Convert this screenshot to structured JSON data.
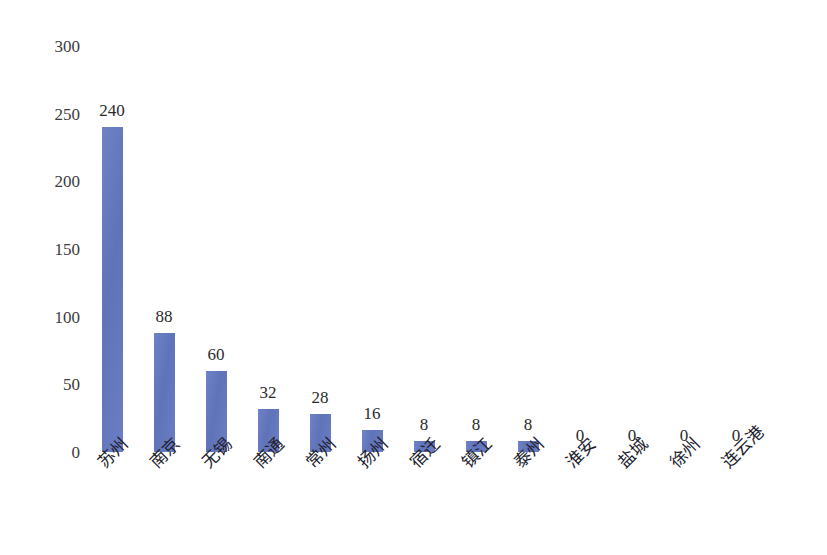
{
  "chart_data": {
    "type": "bar",
    "title": "",
    "xlabel": "",
    "ylabel": "",
    "ylim": [
      0,
      300
    ],
    "yticks": [
      0,
      50,
      100,
      150,
      200,
      250,
      300
    ],
    "grid": false,
    "legend": "none",
    "bar_color": "#6276bd",
    "categories": [
      "苏州",
      "南京",
      "无锡",
      "南通",
      "常州",
      "扬州",
      "宿迁",
      "镇江",
      "泰州",
      "淮安",
      "盐城",
      "徐州",
      "连云港"
    ],
    "values": [
      240,
      88,
      60,
      32,
      28,
      16,
      8,
      8,
      8,
      0,
      0,
      0,
      0
    ],
    "value_labels": [
      "240",
      "88",
      "60",
      "32",
      "28",
      "16",
      "8",
      "8",
      "8",
      "0",
      "0",
      "0",
      "0"
    ],
    "ytick_labels": [
      "300",
      "250",
      "200",
      "150",
      "100",
      "50",
      "0"
    ]
  }
}
